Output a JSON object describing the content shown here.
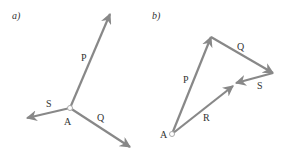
{
  "figure": {
    "colors": {
      "vector": "#888888",
      "text": "#333333",
      "point_fill": "#ffffff"
    },
    "panel_a": {
      "label": "a)",
      "origin": {
        "name": "A",
        "x": 70,
        "y": 108
      },
      "vectors": [
        {
          "name": "P",
          "from": [
            70,
            108
          ],
          "to": [
            110,
            14
          ]
        },
        {
          "name": "S",
          "from": [
            70,
            108
          ],
          "to": [
            27,
            118
          ]
        },
        {
          "name": "Q",
          "from": [
            70,
            108
          ],
          "to": [
            130,
            147
          ]
        }
      ],
      "labels": {
        "P": "P",
        "S": "S",
        "Q": "Q",
        "A": "A"
      }
    },
    "panel_b": {
      "label": "b)",
      "origin": {
        "name": "A",
        "x": 172,
        "y": 134
      },
      "vectors": [
        {
          "name": "P",
          "from": [
            172,
            134
          ],
          "to": [
            211,
            37
          ]
        },
        {
          "name": "Q",
          "from": [
            211,
            37
          ],
          "to": [
            273,
            73
          ]
        },
        {
          "name": "S",
          "from": [
            273,
            73
          ],
          "to": [
            236,
            83
          ]
        },
        {
          "name": "R",
          "from": [
            172,
            134
          ],
          "to": [
            233,
            86
          ]
        }
      ],
      "labels": {
        "P": "P",
        "Q": "Q",
        "S": "S",
        "R": "R",
        "A": "A"
      }
    }
  }
}
